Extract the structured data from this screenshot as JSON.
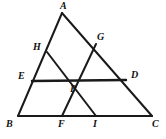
{
  "figure": {
    "kind": "geometry-diagram",
    "width": 166,
    "height": 139,
    "background_color": "#ffffff",
    "stroke_color": "#1a1a1a"
  },
  "points": {
    "A": {
      "label": "A",
      "x": 62,
      "y": 13,
      "label_x": 60,
      "label_y": 1
    },
    "B": {
      "label": "B",
      "x": 18,
      "y": 116,
      "label_x": 6,
      "label_y": 119
    },
    "C": {
      "label": "C",
      "x": 152,
      "y": 116,
      "label_x": 152,
      "label_y": 119
    },
    "D": {
      "label": "D",
      "x": 126,
      "y": 80,
      "label_x": 131,
      "label_y": 70
    },
    "E": {
      "label": "E",
      "x": 32,
      "y": 81,
      "label_x": 18,
      "label_y": 71
    },
    "F": {
      "label": "F",
      "x": 62,
      "y": 116,
      "label_x": 58,
      "label_y": 119
    },
    "G": {
      "label": "G",
      "x": 96,
      "y": 44,
      "label_x": 97,
      "label_y": 32
    },
    "H": {
      "label": "H",
      "x": 47,
      "y": 52,
      "label_x": 33,
      "label_y": 42
    },
    "I": {
      "label": "I",
      "x": 96,
      "y": 116,
      "label_x": 93,
      "label_y": 119
    },
    "P": {
      "label": "P",
      "x": 73,
      "y": 80,
      "label_x": 70,
      "label_y": 84
    }
  },
  "segments": [
    {
      "name": "side-AB",
      "from": "A",
      "to": "B",
      "width": 2
    },
    {
      "name": "side-AC",
      "from": "A",
      "to": "C",
      "width": 2
    },
    {
      "name": "side-BC",
      "from": "B",
      "to": "C",
      "width": 2
    },
    {
      "name": "cevian-HI",
      "from": "H",
      "to": "I",
      "width": 2
    },
    {
      "name": "cevian-GF",
      "from": "G",
      "to": "F",
      "width": 2
    },
    {
      "name": "transversal-ED",
      "from": "E",
      "to": "D",
      "width": 2.4
    }
  ]
}
